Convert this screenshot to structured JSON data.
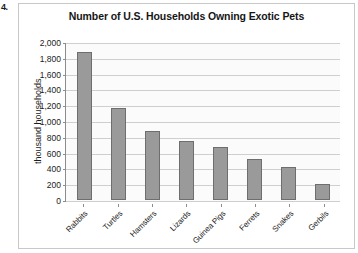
{
  "page_marker": "4.",
  "chart_data": {
    "type": "bar",
    "title": "Number of U.S. Households Owning Exotic Pets",
    "xlabel": "",
    "ylabel": "thousand households",
    "categories": [
      "Rabbits",
      "Turtles",
      "Hamsters",
      "Lizards",
      "Guinea Pigs",
      "Ferrets",
      "Snakes",
      "Gerbils"
    ],
    "values": [
      1880,
      1170,
      880,
      750,
      675,
      520,
      420,
      200
    ],
    "ylim": [
      0,
      2000
    ],
    "ytick_labels": [
      "2,000",
      "1,800",
      "1,600",
      "1,400",
      "1,200",
      "1,000",
      "800",
      "600",
      "400",
      "200",
      "0"
    ],
    "ytick_values": [
      2000,
      1800,
      1600,
      1400,
      1200,
      1000,
      800,
      600,
      400,
      200,
      0
    ],
    "grid": true,
    "legend": "none",
    "bar_color": "#9a9a9a",
    "bar_border_color": "#6e6e6e",
    "gridline_color": "#cfcfcf",
    "axis_color": "#8c8c8c",
    "plot_background": "#fbfbfb",
    "frame_border_color": "#c8c8c8"
  }
}
